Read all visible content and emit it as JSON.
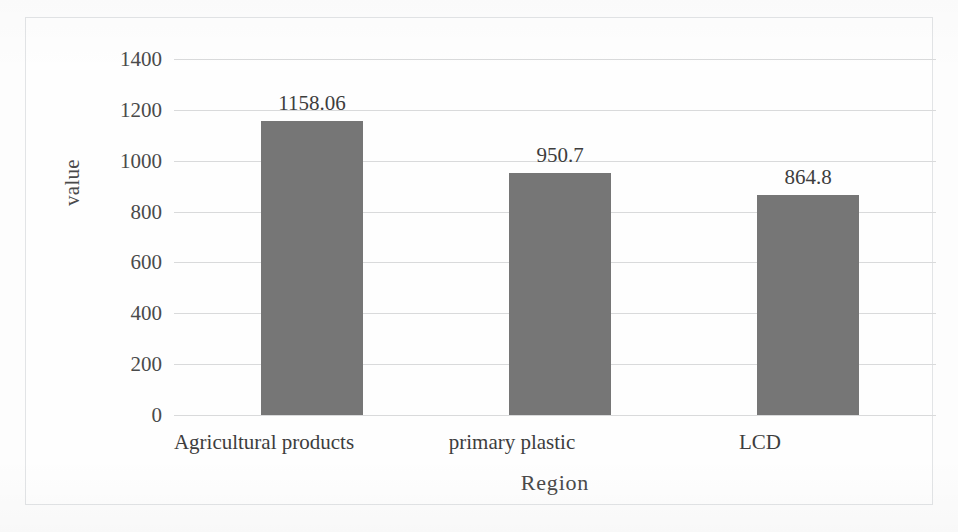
{
  "chart_data": {
    "type": "bar",
    "title": "",
    "subtitle": "",
    "xlabel": "Region",
    "ylabel": "value",
    "categories": [
      "Agricultural products",
      "primary plastic",
      "LCD"
    ],
    "values": [
      1158.06,
      950.7,
      864.8
    ],
    "data_labels": [
      "1158.06",
      "950.7",
      "864.8"
    ],
    "ylim": [
      0,
      1400
    ],
    "ytick_labels": [
      "1400",
      "1200",
      "1000",
      "800",
      "600",
      "400",
      "200",
      "0"
    ],
    "ytick_values": [
      1400,
      1200,
      1000,
      800,
      600,
      400,
      200,
      0
    ],
    "grid": "horizontal",
    "legend": "none",
    "bar_color": "#767676",
    "gridline_color": "#d9dadb",
    "text_color": "#3d3d3d",
    "plot_background": "#fefefe",
    "frame_border_color": "#e2e4e6"
  }
}
